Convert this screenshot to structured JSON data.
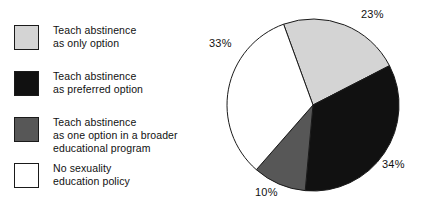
{
  "chart_data": {
    "type": "pie",
    "title": "",
    "subtitle": "",
    "xlabel": "",
    "ylabel": "",
    "grid": false,
    "legend_position": "left",
    "categories": [
      "Teach abstinence\nas only option",
      "Teach abstinence\nas preferred option",
      "Teach abstinence\nas one option in a broader\neducational program",
      "No sexuality\neducation policy"
    ],
    "values": [
      23,
      34,
      10,
      33
    ],
    "value_labels": [
      "23%",
      "34%",
      "10%",
      "33%"
    ],
    "colors": [
      "#d4d4d4",
      "#111111",
      "#575757",
      "#ffffff"
    ],
    "slice_border_color": "#1a1a1a",
    "start_angle_deg": -20,
    "direction": "clockwise",
    "units": "percent"
  },
  "legend": {
    "items": [
      {
        "label": "Teach abstinence\nas only option",
        "color": "#d4d4d4",
        "swatch_name": "legend-swatch-abstinence-only"
      },
      {
        "label": "Teach abstinence\nas preferred option",
        "color": "#111111",
        "swatch_name": "legend-swatch-abstinence-preferred"
      },
      {
        "label": "Teach abstinence\nas one option in a broader\neducational program",
        "color": "#575757",
        "swatch_name": "legend-swatch-abstinence-one-option"
      },
      {
        "label": "No sexuality\neducation policy",
        "color": "#ffffff",
        "swatch_name": "legend-swatch-no-policy"
      }
    ]
  },
  "pie_labels": {
    "light_gray": "23%",
    "black": "34%",
    "dark_gray": "10%",
    "white": "33%"
  }
}
